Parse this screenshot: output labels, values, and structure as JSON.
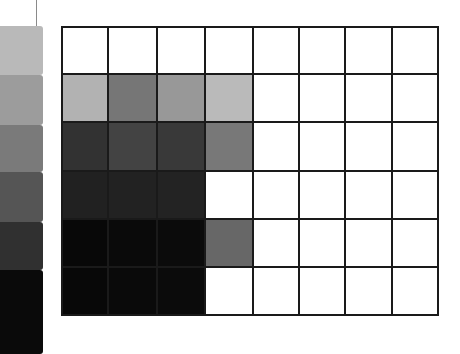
{
  "figure": {
    "grid": {
      "columns": 8,
      "rows": 6,
      "col_edges": [
        0,
        46,
        95,
        143,
        191,
        237,
        283,
        330,
        376
      ],
      "row_edges": [
        0,
        47,
        95,
        144,
        192,
        240,
        288
      ],
      "line_color": "#1a1a1a",
      "cells": [
        [
          "#ffffff",
          "#ffffff",
          "#ffffff",
          "#ffffff",
          "#ffffff",
          "#ffffff",
          "#ffffff",
          "#ffffff"
        ],
        [
          "#b2b2b2",
          "#767676",
          "#989898",
          "#bababa",
          "#ffffff",
          "#ffffff",
          "#ffffff",
          "#ffffff"
        ],
        [
          "#323232",
          "#434343",
          "#393939",
          "#787878",
          "#ffffff",
          "#ffffff",
          "#ffffff",
          "#ffffff"
        ],
        [
          "#212121",
          "#222222",
          "#232323",
          "#ffffff",
          "#ffffff",
          "#ffffff",
          "#ffffff",
          "#ffffff"
        ],
        [
          "#080808",
          "#0a0a0a",
          "#0b0b0b",
          "#676767",
          "#ffffff",
          "#ffffff",
          "#ffffff",
          "#ffffff"
        ],
        [
          "#080808",
          "#0a0a0a",
          "#0b0b0b",
          "#ffffff",
          "#ffffff",
          "#ffffff",
          "#ffffff",
          "#ffffff"
        ]
      ]
    },
    "strip": {
      "bands": [
        {
          "top": 0,
          "height": 49,
          "color": "#b9b9b9"
        },
        {
          "top": 49,
          "height": 50,
          "color": "#9c9c9c"
        },
        {
          "top": 99,
          "height": 47,
          "color": "#7a7a7a"
        },
        {
          "top": 146,
          "height": 50,
          "color": "#555555"
        },
        {
          "top": 196,
          "height": 48,
          "color": "#303030"
        },
        {
          "top": 244,
          "height": 84,
          "color": "#0a0a0a"
        }
      ]
    }
  }
}
